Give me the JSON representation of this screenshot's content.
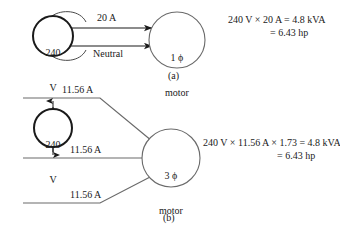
{
  "figure": {
    "background": "#ffffff",
    "ink": "#1a1a1a"
  },
  "part_a": {
    "caption": "(a)",
    "source": {
      "line1": "240",
      "line2": "V"
    },
    "motor": {
      "line1": "1 ϕ",
      "line2": "motor"
    },
    "conductor_top_label": "20 A",
    "conductor_bottom_label": "Neutral",
    "equation_line1": "240 V × 20 A = 4.8 kVA",
    "equation_line2": "= 6.43 hp"
  },
  "part_b": {
    "caption": "(b)",
    "source": {
      "line1": "240",
      "line2": "V"
    },
    "motor": {
      "line1": "3 ϕ",
      "line2": "motor"
    },
    "conductor_labels": [
      "11.56 A",
      "11.56 A",
      "11.56 A"
    ],
    "equation_line1": "240 V × 11.56 A × 1.73 = 4.8 kVA",
    "equation_line2": "= 6.43 hp"
  }
}
